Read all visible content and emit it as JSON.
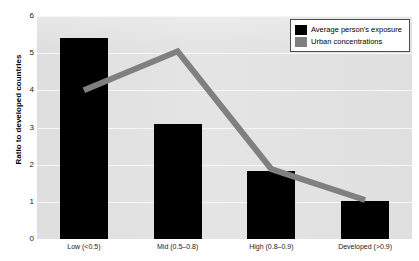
{
  "chart_data": {
    "type": "bar",
    "title": "",
    "subtitle": "",
    "xlabel": "",
    "ylabel": "Ratio to developed countries",
    "categories": [
      "Low (<0.5)",
      "Mid (0.5–0.8)",
      "High (0.8–0.9)",
      "Developed (>0.9)"
    ],
    "series": [
      {
        "name": "Average person's exposure",
        "type": "bar",
        "color": "#000000",
        "values": [
          5.4,
          3.1,
          1.82,
          1.02
        ]
      },
      {
        "name": "Urban concentrations",
        "type": "line",
        "color": "#808080",
        "values": [
          4.0,
          5.05,
          1.88,
          1.05
        ]
      }
    ],
    "ylim": [
      0,
      6
    ],
    "yticks": [
      0,
      1,
      2,
      3,
      4,
      5,
      6
    ],
    "ytick_labels": [
      "0",
      "1",
      "2",
      "3",
      "4",
      "5",
      "6"
    ],
    "grid": true,
    "grid_color": "#f7f7f7",
    "plot_background": "#e3e3e3",
    "legend_position": "top-right"
  },
  "legend": {
    "items": [
      {
        "label": "Average person's exposure",
        "color": "#000000",
        "swatch": "black-square-swatch"
      },
      {
        "label": "Urban concentrations",
        "color": "#808080",
        "swatch": "gray-square-swatch"
      }
    ]
  }
}
